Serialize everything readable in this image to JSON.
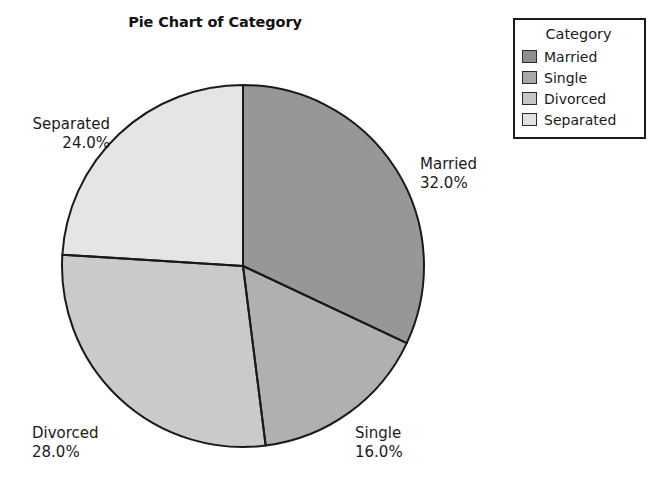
{
  "chart_data": {
    "type": "pie",
    "title": "Pie Chart of Category",
    "legend_title": "Category",
    "legend_position": "top-right",
    "start_angle_deg": 0,
    "direction": "clockwise",
    "categories": [
      "Married",
      "Single",
      "Divorced",
      "Separated"
    ],
    "values": [
      32.0,
      16.0,
      28.0,
      24.0
    ],
    "value_labels": [
      "32.0%",
      "16.0%",
      "28.0%",
      "24.0%"
    ],
    "units": "percent",
    "slices": [
      {
        "name": "Married",
        "value": 32.0,
        "label": "Married",
        "percent_label": "32.0%",
        "color": "#8e8e8e",
        "start_deg": 0.0,
        "end_deg": 115.2
      },
      {
        "name": "Single",
        "value": 16.0,
        "label": "Single",
        "percent_label": "16.0%",
        "color": "#a9a9a9",
        "start_deg": 115.2,
        "end_deg": 172.8
      },
      {
        "name": "Divorced",
        "value": 28.0,
        "label": "Divorced",
        "percent_label": "28.0%",
        "color": "#c6c6c6",
        "start_deg": 172.8,
        "end_deg": 273.6
      },
      {
        "name": "Separated",
        "value": 24.0,
        "label": "Separated",
        "percent_label": "24.0%",
        "color": "#e2e2e2",
        "start_deg": 273.6,
        "end_deg": 360.0
      }
    ],
    "outline_color": "#1a1a1a"
  },
  "legend": {
    "title": "Category",
    "items": [
      {
        "label": "Married",
        "color": "#8e8e8e"
      },
      {
        "label": "Single",
        "color": "#a9a9a9"
      },
      {
        "label": "Divorced",
        "color": "#c6c6c6"
      },
      {
        "label": "Separated",
        "color": "#e2e2e2"
      }
    ]
  }
}
